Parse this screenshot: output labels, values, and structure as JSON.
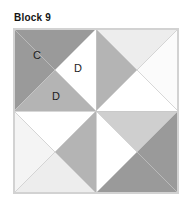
{
  "title": "Block 9",
  "colors": {
    "background": "#ffffff",
    "block_border": "#d2d2d2",
    "dark_gray": "#9a9a9a",
    "medium_gray": "#b4b4b4",
    "light_gray": "#cfcfcf",
    "pale_gray": "#ededed",
    "white": "#ffffff",
    "seam_line": "#c8c8c8",
    "text": "#1d1d1d"
  },
  "labels": {
    "c": "C",
    "d1": "D",
    "d2": "D"
  },
  "block": {
    "size": 164,
    "quadrant_size": 82,
    "description": "Pinwheel quilt block, four rotated quadrants"
  },
  "patches": [
    {
      "id": "tl-dark-c",
      "quadrant": "top-left",
      "label": "C",
      "fill": "dark_gray",
      "points": "0,0 82,0 0,82"
    },
    {
      "id": "tl-medium-d",
      "quadrant": "top-left",
      "label": "D",
      "fill": "medium_gray",
      "points": "0,82 41,41 82,82"
    },
    {
      "id": "tl-white-d",
      "quadrant": "top-left",
      "label": "D",
      "fill": "white",
      "points": "82,0 82,82 41,41"
    },
    {
      "id": "tr-medium",
      "quadrant": "top-right",
      "label": "",
      "fill": "medium_gray",
      "points": "0,0 41,41 0,82"
    },
    {
      "id": "tr-pale-top",
      "quadrant": "top-right",
      "label": "",
      "fill": "pale_gray",
      "points": "0,0 82,0 41,41"
    },
    {
      "id": "tr-white-right",
      "quadrant": "top-right",
      "label": "",
      "fill": "white",
      "points": "82,0 82,82 41,41"
    },
    {
      "id": "tr-white-bot",
      "quadrant": "top-right",
      "label": "",
      "fill": "white",
      "points": "0,82 41,41 82,82"
    },
    {
      "id": "bl-pale-left",
      "quadrant": "bottom-left",
      "label": "",
      "fill": "pale_gray",
      "points": "0,0 41,41 0,82"
    },
    {
      "id": "bl-white-top",
      "quadrant": "bottom-left",
      "label": "",
      "fill": "white",
      "points": "0,0 82,0 41,41"
    },
    {
      "id": "bl-medium-br",
      "quadrant": "bottom-left",
      "label": "",
      "fill": "medium_gray",
      "points": "82,0 82,82 41,41"
    },
    {
      "id": "bl-pale-bot",
      "quadrant": "bottom-left",
      "label": "",
      "fill": "pale_gray",
      "points": "0,82 41,41 82,82"
    },
    {
      "id": "br-light-top",
      "quadrant": "bottom-right",
      "label": "",
      "fill": "light_gray",
      "points": "0,0 82,0 41,41"
    },
    {
      "id": "br-white-left",
      "quadrant": "bottom-right",
      "label": "",
      "fill": "white",
      "points": "0,0 41,41 0,82"
    },
    {
      "id": "br-dark",
      "quadrant": "bottom-right",
      "label": "",
      "fill": "dark_gray",
      "points": "82,0 82,82 0,82 41,41"
    }
  ]
}
